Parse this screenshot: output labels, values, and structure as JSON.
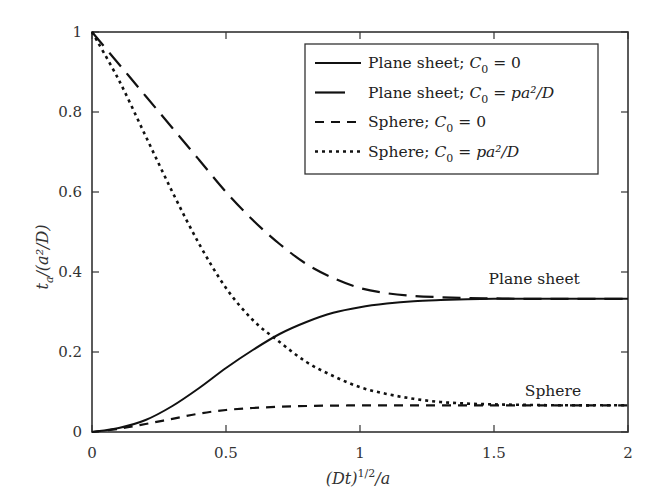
{
  "chart_data": {
    "type": "line",
    "title": "",
    "xlabel": "(Dt)^1/2/a",
    "ylabel": "t_a/(a^2/D)",
    "xlim": [
      0,
      2
    ],
    "ylim": [
      0,
      1
    ],
    "grid": false,
    "legend_position": "upper right (inside)",
    "xticks": [
      0,
      0.5,
      1,
      1.5,
      2
    ],
    "xtick_labels": [
      "0",
      "0.5",
      "1",
      "1.5",
      "2"
    ],
    "yticks": [
      0,
      0.2,
      0.4,
      0.6,
      0.8,
      1
    ],
    "ytick_labels": [
      "0",
      "0.2",
      "0.4",
      "0.6",
      "0.8",
      "1"
    ],
    "x": [
      0,
      0.1,
      0.2,
      0.3,
      0.4,
      0.5,
      0.6,
      0.7,
      0.8,
      0.9,
      1.0,
      1.1,
      1.2,
      1.3,
      1.4,
      1.5,
      1.6,
      1.7,
      1.8,
      1.9,
      2.0
    ],
    "series": [
      {
        "name": "Plane sheet; C0 = 0",
        "style": "solid",
        "values": [
          0,
          0.01,
          0.03,
          0.065,
          0.11,
          0.16,
          0.205,
          0.245,
          0.275,
          0.298,
          0.312,
          0.321,
          0.327,
          0.33,
          0.332,
          0.333,
          0.333,
          0.333,
          0.333,
          0.333,
          0.333
        ]
      },
      {
        "name": "Plane sheet; C0 = pa^2/D",
        "style": "long-dash",
        "values": [
          1,
          0.92,
          0.84,
          0.76,
          0.68,
          0.6,
          0.53,
          0.47,
          0.42,
          0.385,
          0.36,
          0.347,
          0.34,
          0.337,
          0.335,
          0.334,
          0.333,
          0.333,
          0.333,
          0.333,
          0.333
        ]
      },
      {
        "name": "Sphere; C0 = 0",
        "style": "short-dash",
        "values": [
          0,
          0.008,
          0.02,
          0.033,
          0.046,
          0.055,
          0.06,
          0.063,
          0.065,
          0.066,
          0.0665,
          0.0667,
          0.0667,
          0.0667,
          0.0667,
          0.0667,
          0.0667,
          0.0667,
          0.0667,
          0.0667,
          0.0667
        ]
      },
      {
        "name": "Sphere; C0 = pa^2/D",
        "style": "dotted",
        "values": [
          1,
          0.88,
          0.74,
          0.6,
          0.47,
          0.36,
          0.28,
          0.225,
          0.175,
          0.14,
          0.112,
          0.095,
          0.083,
          0.075,
          0.071,
          0.069,
          0.068,
          0.067,
          0.0667,
          0.0667,
          0.0667
        ]
      }
    ],
    "annotations": [
      {
        "text": "Plane sheet",
        "x": 1.65,
        "y": 0.37
      },
      {
        "text": "Sphere",
        "x": 1.72,
        "y": 0.09
      }
    ]
  },
  "legend": {
    "items": [
      {
        "label": "Plane sheet; ",
        "c": "C",
        "sub": "0",
        "rhs": " = 0"
      },
      {
        "label": "Plane sheet; ",
        "c": "C",
        "sub": "0",
        "rhs": " = pa²/D"
      },
      {
        "label": "Sphere; ",
        "c": "C",
        "sub": "0",
        "rhs": " = 0"
      },
      {
        "label": "Sphere; ",
        "c": "C",
        "sub": "0",
        "rhs": " = pa²/D"
      }
    ]
  },
  "axes": {
    "xlabel_main": "(Dt)",
    "xlabel_sup": "1/2",
    "xlabel_tail": "/a",
    "ylabel_main": "t",
    "ylabel_sub": "a",
    "ylabel_tail": "/(a²/D)"
  }
}
